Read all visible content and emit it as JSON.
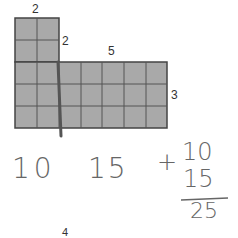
{
  "figure": {
    "top_block": {
      "cols": 2,
      "rows": 2,
      "label_width": "2",
      "label_height": "2"
    },
    "bottom_block": {
      "cols": 7,
      "rows": 3,
      "label_width": "5",
      "label_height": "3"
    },
    "cell_color": "#a9a9a9",
    "line_color": "#444444"
  },
  "handwriting": {
    "first": "10",
    "second": "15",
    "plus": "+",
    "addend1": "10",
    "addend2": "15",
    "sum": "25"
  },
  "footer": {
    "page_number": "4"
  }
}
